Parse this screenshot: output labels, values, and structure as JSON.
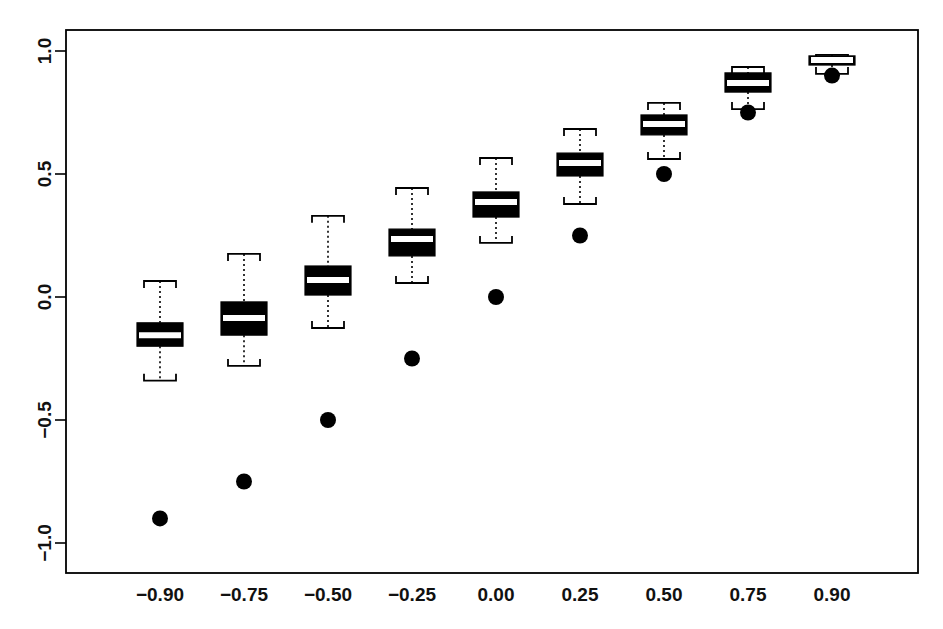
{
  "chart_data": {
    "type": "boxplot",
    "title": "",
    "subtitle": "",
    "xlabel": "",
    "ylabel": "",
    "categories": [
      "-0.90",
      "-0.75",
      "-0.50",
      "-0.25",
      "0.00",
      "0.25",
      "0.50",
      "0.75",
      "0.90"
    ],
    "xtick_labels": [
      "−0.90",
      "−0.75",
      "−0.50",
      "−0.25",
      "0.00",
      "0.25",
      "0.50",
      "0.75",
      "0.90"
    ],
    "ytick_labels": [
      "1.0",
      "0.5",
      "0.0",
      "−0.5",
      "−1.0"
    ],
    "ytick_values": [
      1.0,
      0.5,
      0.0,
      -0.5,
      -1.0
    ],
    "ylim": [
      -1.1,
      1.1
    ],
    "grid": false,
    "legend": "none",
    "frame": true,
    "box_fill_color": "#000000",
    "median_color": "#ffffff",
    "whisker_style": "dotted",
    "point_color": "#000000",
    "boxes": [
      {
        "category": "-0.90",
        "whisker_low": -0.34,
        "q1": -0.2,
        "median": -0.155,
        "q3": -0.105,
        "whisker_high": 0.065,
        "truth": -0.9
      },
      {
        "category": "-0.75",
        "whisker_low": -0.28,
        "q1": -0.155,
        "median": -0.085,
        "q3": -0.02,
        "whisker_high": 0.175,
        "truth": -0.75
      },
      {
        "category": "-0.50",
        "whisker_low": -0.126,
        "q1": 0.008,
        "median": 0.069,
        "q3": 0.126,
        "whisker_high": 0.33,
        "truth": -0.5
      },
      {
        "category": "-0.25",
        "whisker_low": 0.057,
        "q1": 0.167,
        "median": 0.236,
        "q3": 0.276,
        "whisker_high": 0.443,
        "truth": -0.25
      },
      {
        "category": "0.00",
        "whisker_low": 0.22,
        "q1": 0.325,
        "median": 0.386,
        "q3": 0.427,
        "whisker_high": 0.565,
        "truth": 0.0
      },
      {
        "category": "0.25",
        "whisker_low": 0.378,
        "q1": 0.492,
        "median": 0.545,
        "q3": 0.585,
        "whisker_high": 0.683,
        "truth": 0.25
      },
      {
        "category": "0.50",
        "whisker_low": 0.561,
        "q1": 0.659,
        "median": 0.703,
        "q3": 0.74,
        "whisker_high": 0.789,
        "truth": 0.5
      },
      {
        "category": "0.75",
        "whisker_low": 0.764,
        "q1": 0.833,
        "median": 0.87,
        "q3": 0.911,
        "whisker_high": 0.935,
        "truth": 0.75
      },
      {
        "category": "0.90",
        "whisker_low": 0.907,
        "q1": 0.943,
        "median": 0.963,
        "q3": 0.98,
        "whisker_high": 0.984,
        "truth": 0.9
      }
    ]
  },
  "axes": {
    "y_axis_name": "y-axis",
    "x_axis_name": "x-axis"
  }
}
